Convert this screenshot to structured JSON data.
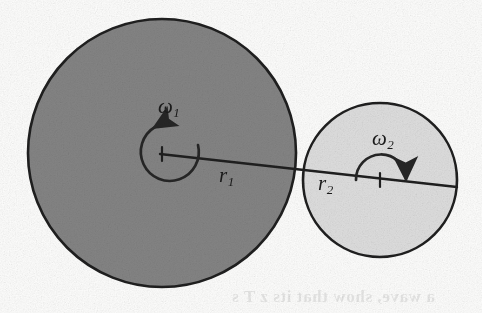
{
  "figure": {
    "type": "mechanics-diagram",
    "background_color": "#fdfdfc",
    "stroke_color": "#2a2a2a"
  },
  "disks": [
    {
      "id": "disk-1",
      "name": "large-disk",
      "center_x": 162,
      "center_y": 153,
      "radius": 135,
      "fill_color": "#848484",
      "radius_label": "r",
      "radius_subscript": "1",
      "angular_velocity_label": "ω",
      "angular_velocity_subscript": "1",
      "rotation_sense": "counterclockwise"
    },
    {
      "id": "disk-2",
      "name": "small-disk",
      "center_x": 380,
      "center_y": 180,
      "radius": 77,
      "fill_color": "#dedede",
      "radius_label": "r",
      "radius_subscript": "2",
      "angular_velocity_label": "ω",
      "angular_velocity_subscript": "2",
      "rotation_sense": "clockwise"
    }
  ],
  "labels": {
    "omega1": {
      "symbol": "ω",
      "subscript": "1"
    },
    "omega2": {
      "symbol": "ω",
      "subscript": "2"
    },
    "r1": {
      "symbol": "r",
      "subscript": "1"
    },
    "r2": {
      "symbol": "r",
      "subscript": "2"
    }
  },
  "radius_line": {
    "name": "radius-line",
    "from_x": 162,
    "from_y": 153,
    "to_x": 458,
    "to_y": 186,
    "tangent_x": 305,
    "tangent_y": 170
  },
  "ghost_text": "a wave, show that its z T s"
}
